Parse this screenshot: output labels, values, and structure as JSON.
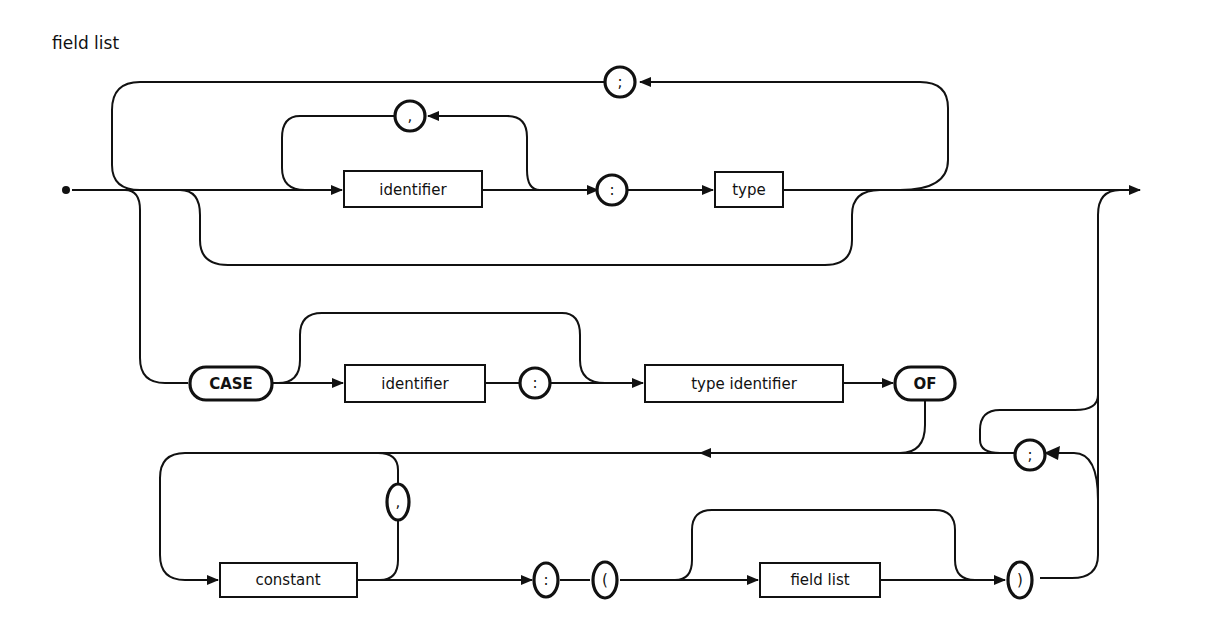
{
  "diagram": {
    "title": "field list",
    "type": "syntax railroad diagram",
    "nodes": {
      "separator_semicolon_top": ";",
      "separator_comma_top": ",",
      "identifier_top": "identifier",
      "colon_top": ":",
      "type_box": "type",
      "case_keyword": "CASE",
      "identifier_case": "identifier",
      "colon_case": ":",
      "type_identifier_box": "type identifier",
      "of_keyword": "OF",
      "separator_semicolon_variant": ";",
      "separator_comma_constant": ",",
      "constant_box": "constant",
      "colon_variant": ":",
      "open_paren": "(",
      "field_list_box": "field list",
      "close_paren": ")"
    },
    "colors": {
      "stroke": "#111111",
      "background": "#ffffff"
    }
  }
}
